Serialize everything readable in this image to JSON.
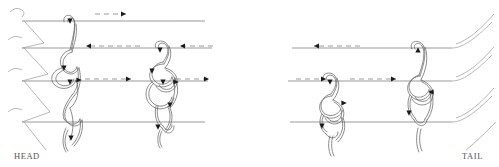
{
  "figure": {
    "type": "knot-weaving-diagram",
    "title_visible": false,
    "labels": {
      "head": "HEAD",
      "tail": "TAIL"
    },
    "colors": {
      "stroke": "#6e6e6e",
      "knot_stroke": "#5a5a5a",
      "arrow": "#1a1a1a",
      "dash": "#8a8a8a",
      "background": "#ffffff",
      "text": "#555555"
    },
    "panels": [
      {
        "name": "left-panel",
        "x_start": 8,
        "x_end": 215
      },
      {
        "name": "right-panel",
        "x_start": 288,
        "x_end": 492
      }
    ],
    "warp_rows": [
      {
        "index": 1,
        "y": 21
      },
      {
        "index": 2,
        "y": 48
      },
      {
        "index": 3,
        "y": 81
      },
      {
        "index": 4,
        "y": 122
      }
    ],
    "left_panel": {
      "edge_style": "zigzag-folded-selvedge",
      "knots": [
        {
          "name": "knot-left-outer",
          "cx": 72,
          "y_top": 16,
          "y_bottom": 147,
          "loops": 3
        },
        {
          "name": "knot-left-inner",
          "cx": 163,
          "y_top": 42,
          "y_bottom": 140,
          "loops": 4
        }
      ],
      "flow_arrows": [
        {
          "name": "arrow-row1-right",
          "row": 1,
          "y": 14,
          "x_from": 95,
          "x_to": 130,
          "direction": "right",
          "style": "dashed"
        },
        {
          "name": "arrow-row2-left-a",
          "row": 2,
          "y": 46,
          "x_from": 140,
          "x_to": 82,
          "direction": "left",
          "style": "dashed"
        },
        {
          "name": "arrow-row2-left-b",
          "row": 2,
          "y": 46,
          "x_from": 215,
          "x_to": 178,
          "direction": "left",
          "style": "dashed"
        },
        {
          "name": "arrow-row3-right-a",
          "row": 3,
          "y": 79,
          "x_from": 85,
          "x_to": 135,
          "direction": "right",
          "style": "dashed"
        },
        {
          "name": "arrow-row3-right-b",
          "row": 3,
          "y": 79,
          "x_from": 175,
          "x_to": 212,
          "direction": "right",
          "style": "dashed"
        }
      ]
    },
    "right_panel": {
      "edge_style": "curved-open-strands",
      "knots": [
        {
          "name": "knot-right-inner",
          "cx": 330,
          "y_top": 72,
          "y_bottom": 145,
          "loops": 3
        },
        {
          "name": "knot-right-outer",
          "cx": 418,
          "y_top": 40,
          "y_bottom": 145,
          "loops": 3
        }
      ],
      "flow_arrows": [
        {
          "name": "arrow-row2-left",
          "row": 2,
          "y": 46,
          "x_from": 360,
          "x_to": 310,
          "direction": "left",
          "style": "dashed"
        },
        {
          "name": "arrow-row3-right-a",
          "row": 3,
          "y": 79,
          "x_from": 296,
          "x_to": 330,
          "direction": "right",
          "style": "dashed"
        },
        {
          "name": "arrow-row3-right-b",
          "row": 3,
          "y": 79,
          "x_from": 348,
          "x_to": 400,
          "direction": "right",
          "style": "dashed"
        }
      ]
    },
    "knot_direction_markers": {
      "description": "small solid triangular arrowheads on the knot cords indicating working direction",
      "count_left": 7,
      "count_right": 6
    }
  }
}
